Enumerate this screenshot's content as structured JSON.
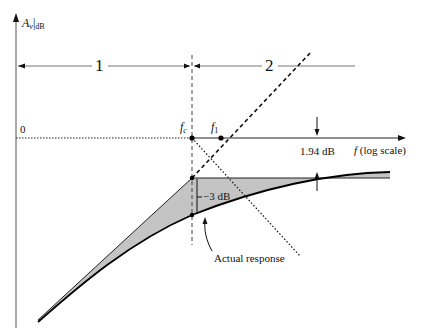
{
  "diagram": {
    "y_axis": {
      "label_main": "A",
      "label_sub_v": "v",
      "label_sub_db": "dB"
    },
    "x_axis": {
      "label_f": "f",
      "label_scale": "(log scale)",
      "zero_label": "0"
    },
    "regions": [
      {
        "label": "1"
      },
      {
        "label": "2"
      }
    ],
    "frequencies": {
      "fc_main": "f",
      "fc_sub": "c",
      "f1_main": "f",
      "f1_sub": "1"
    },
    "annotations": {
      "minus_3db": "−3 dB",
      "deviation_194": "1.94 dB",
      "actual_response": "Actual response"
    },
    "colors": {
      "shade": "#c4c4c4",
      "line": "#111111",
      "axis": "#555555"
    }
  }
}
